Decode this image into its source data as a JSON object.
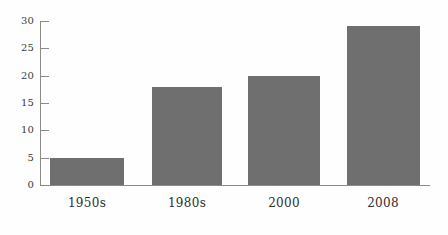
{
  "chart_data": {
    "type": "bar",
    "title": "",
    "subtitle": "",
    "xlabel": "",
    "ylabel": "",
    "categories": [
      "1950s",
      "1980s",
      "2000",
      "2008"
    ],
    "values": [
      5,
      18,
      20,
      29
    ],
    "series": [
      {
        "name": "",
        "values": [
          5,
          18,
          20,
          29
        ]
      }
    ],
    "ylim": [
      0,
      30
    ],
    "yticks": [
      0,
      5,
      10,
      15,
      20,
      25,
      30
    ],
    "ytick_labels": [
      "0",
      "5",
      "10",
      "15",
      "20",
      "25",
      "30"
    ],
    "grid": false,
    "legend": false,
    "legend_position": "none",
    "annotations": [],
    "colors": {
      "bar_fill": "#6f6f6f",
      "axis": "#8a8a8a",
      "tick_label": "#3b3b3b",
      "category_label": "#2d2d2d",
      "background": "#fefefe"
    }
  }
}
